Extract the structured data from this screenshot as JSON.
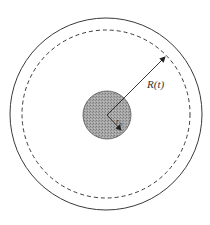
{
  "diagram": {
    "type": "concentric-circles",
    "labels": {
      "outer_radius": "R(t)",
      "inner_radius_main": "r",
      "inner_radius_sub": "b"
    },
    "colors": {
      "background": "#ffffff",
      "stroke": "#3a3a3a",
      "inner_fill": "#9a9a9a"
    },
    "geometry": {
      "center": [
        106,
        114
      ],
      "outer_circle_r": 96,
      "dashed_circle_r": 84,
      "inner_circle_r": 24
    }
  }
}
